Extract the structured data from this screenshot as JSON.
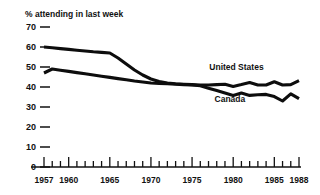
{
  "chart_data": {
    "type": "line",
    "title": "",
    "ylabel": "% attending in last week",
    "xlabel": "",
    "ylim": [
      0,
      70
    ],
    "xlim": [
      1957,
      1988
    ],
    "grid": false,
    "legend_position": "inline-right",
    "ytick_labels": [
      "0",
      "10",
      "20",
      "30",
      "40",
      "50",
      "60",
      "70"
    ],
    "ytick_values": [
      0,
      10,
      20,
      30,
      40,
      50,
      60,
      70
    ],
    "xtick_labels": [
      "1957",
      "1960",
      "1965",
      "1970",
      "1975",
      "1980",
      "1985",
      "1988"
    ],
    "xtick_values": [
      1957,
      1960,
      1965,
      1970,
      1975,
      1980,
      1985,
      1988
    ],
    "xtick_minor_values": [
      1958,
      1959,
      1961,
      1962,
      1963,
      1964,
      1966,
      1967,
      1968,
      1969,
      1971,
      1972,
      1973,
      1974,
      1976,
      1977,
      1978,
      1979,
      1981,
      1982,
      1983,
      1984,
      1986,
      1987
    ],
    "x": [
      1957,
      1958,
      1959,
      1960,
      1961,
      1962,
      1963,
      1964,
      1965,
      1966,
      1967,
      1968,
      1969,
      1970,
      1971,
      1972,
      1973,
      1974,
      1975,
      1976,
      1977,
      1978,
      1979,
      1980,
      1981,
      1982,
      1983,
      1984,
      1985,
      1986,
      1987,
      1988
    ],
    "series": [
      {
        "name": "United States",
        "label": "United States",
        "color": "#0d0d0d",
        "label_x": 1980.4,
        "label_y": 48.5,
        "values": [
          60,
          59.6,
          59.2,
          58.8,
          58.4,
          58.0,
          57.6,
          57.3,
          57.0,
          54.5,
          51.5,
          48.5,
          46.0,
          44.0,
          42.8,
          42.0,
          41.6,
          41.4,
          41.2,
          41.0,
          41.0,
          41.2,
          41.4,
          40.3,
          41.2,
          42.2,
          41.0,
          41.0,
          42.6,
          41.0,
          41.2,
          43.2
        ]
      },
      {
        "name": "Canada",
        "label": "Canada",
        "color": "#0d0d0d",
        "label_x": 1979.6,
        "label_y": 32.5,
        "values": [
          47,
          49,
          48.4,
          47.8,
          47.2,
          46.6,
          46.0,
          45.4,
          44.8,
          44.2,
          43.6,
          43.0,
          42.5,
          42.0,
          41.8,
          41.6,
          41.4,
          41.2,
          41.0,
          40.6,
          39.4,
          38.2,
          37.0,
          35.8,
          37.0,
          35.8,
          36.1,
          36.3,
          35.2,
          33.0,
          36.6,
          34.2
        ]
      }
    ]
  }
}
